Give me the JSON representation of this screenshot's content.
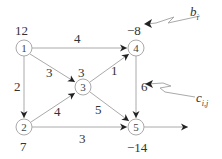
{
  "diagram": {
    "type": "network-flow-graph",
    "nodes": [
      {
        "id": "1",
        "label": "1",
        "supply": "12"
      },
      {
        "id": "2",
        "label": "2",
        "supply": "7"
      },
      {
        "id": "3",
        "label": "3",
        "supply": "3"
      },
      {
        "id": "4",
        "label": "4",
        "supply": "−8"
      },
      {
        "id": "5",
        "label": "5",
        "supply": "−14"
      }
    ],
    "edges": [
      {
        "from": "1",
        "to": "4",
        "cost": "4"
      },
      {
        "from": "1",
        "to": "3",
        "cost": "3"
      },
      {
        "from": "1",
        "to": "2",
        "cost": "2"
      },
      {
        "from": "2",
        "to": "3",
        "cost": "4"
      },
      {
        "from": "2",
        "to": "5",
        "cost": "3"
      },
      {
        "from": "3",
        "to": "4",
        "cost": "1"
      },
      {
        "from": "3",
        "to": "5",
        "cost": "5"
      },
      {
        "from": "4",
        "to": "5",
        "cost": "6"
      }
    ],
    "annotations": {
      "supply_label": "b",
      "supply_sub": "i",
      "cost_label": "c",
      "cost_sub": "i,j"
    },
    "colors": {
      "line": "#aaaaaa",
      "arrow": "#222222",
      "text": "#333333"
    }
  }
}
